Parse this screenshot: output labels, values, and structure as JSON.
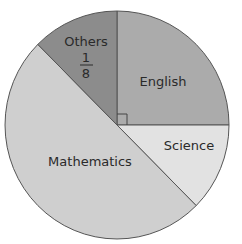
{
  "chart_data": {
    "type": "pie",
    "title": "",
    "slices": [
      {
        "label": "English",
        "fraction": 0.25,
        "fraction_text": "",
        "color": "#ababab"
      },
      {
        "label": "Science",
        "fraction": 0.125,
        "fraction_text": "",
        "color": "#e2e2e2"
      },
      {
        "label": "Mathematics",
        "fraction": 0.5,
        "fraction_text": "",
        "color": "#cfcfcf"
      },
      {
        "label": "Others",
        "fraction": 0.125,
        "fraction_text": "1/8",
        "color": "#8c8c8c"
      }
    ],
    "annotations": [
      "right-angle marker at center between English slice edges"
    ],
    "legend": "none (labels inside slices)"
  },
  "labels": {
    "english": "English",
    "science": "Science",
    "mathematics": "Mathematics",
    "others": "Others",
    "others_num": "1",
    "others_den": "8"
  }
}
